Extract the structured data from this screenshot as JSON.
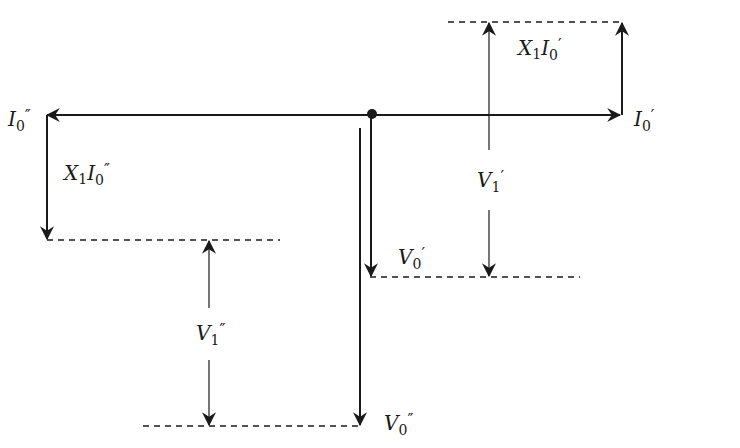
{
  "diagram": {
    "type": "phasor-diagram",
    "colors": {
      "line": "#1a1a1a",
      "background": "#ffffff"
    },
    "labels": {
      "i0_prime": {
        "main": "I",
        "sub": "0",
        "mark": "′"
      },
      "i0_double_prime": {
        "main": "I",
        "sub": "0",
        "mark": "″"
      },
      "x1i0_prime": {
        "main": "X",
        "sub1": "1",
        "main2": "I",
        "sub": "0",
        "mark": "′"
      },
      "x1i0_double_prime": {
        "main": "X",
        "sub1": "1",
        "main2": "I",
        "sub": "0",
        "mark": "″"
      },
      "v1_prime": {
        "main": "V",
        "sub": "1",
        "mark": "′"
      },
      "v1_double_prime": {
        "main": "V",
        "sub": "1",
        "mark": "″"
      },
      "v0_prime": {
        "main": "V",
        "sub": "0",
        "mark": "′"
      },
      "v0_double_prime": {
        "main": "V",
        "sub": "0",
        "mark": "″"
      }
    }
  }
}
